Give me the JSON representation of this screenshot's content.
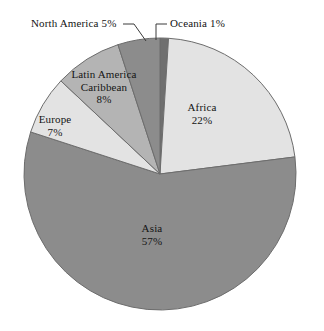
{
  "chart_data": {
    "type": "pie",
    "title": "",
    "subtitle": "",
    "xlabel": "",
    "ylabel": "",
    "legend_position": "none",
    "grid": false,
    "start_angle_deg": 0,
    "direction": "clockwise",
    "categories": [
      "Oceania",
      "Africa",
      "Asia",
      "Europe",
      "Latin America Caribbean",
      "North America"
    ],
    "values": [
      1,
      22,
      57,
      7,
      8,
      5
    ],
    "unit": "percent",
    "slices": [
      {
        "name": "Oceania",
        "label": "Oceania 1%",
        "label_lines": [
          "Oceania 1%"
        ],
        "value": 1,
        "value_text": "1%",
        "color": "#6f6f6f",
        "label_placement": "callout",
        "start_deg": 0,
        "end_deg": 3.6
      },
      {
        "name": "Africa",
        "label": "Africa 22%",
        "label_lines": [
          "Africa",
          "22%"
        ],
        "value": 22,
        "value_text": "22%",
        "color": "#e3e3e3",
        "label_placement": "inside",
        "start_deg": 3.6,
        "end_deg": 82.8
      },
      {
        "name": "Asia",
        "label": "Asia 57%",
        "label_lines": [
          "Asia",
          "57%"
        ],
        "value": 57,
        "value_text": "57%",
        "color": "#8c8c8c",
        "label_placement": "inside",
        "start_deg": 82.8,
        "end_deg": 288.0
      },
      {
        "name": "Europe",
        "label": "Europe 7%",
        "label_lines": [
          "Europe",
          "7%"
        ],
        "value": 7,
        "value_text": "7%",
        "color": "#e3e3e3",
        "label_placement": "inside",
        "start_deg": 288.0,
        "end_deg": 313.2
      },
      {
        "name": "Latin America Caribbean",
        "label": "Latin America Caribbean 8%",
        "label_lines": [
          "Latin America",
          "Caribbean",
          "8%"
        ],
        "value": 8,
        "value_text": "8%",
        "color": "#b4b4b4",
        "label_placement": "inside",
        "start_deg": 313.2,
        "end_deg": 342.0
      },
      {
        "name": "North America",
        "label": "North America 5%",
        "label_lines": [
          "North America 5%"
        ],
        "value": 5,
        "value_text": "5%",
        "color": "#8c8c8c",
        "label_placement": "callout",
        "start_deg": 342.0,
        "end_deg": 360.0
      }
    ],
    "geometry": {
      "center_x": 160,
      "center_y": 174,
      "radius": 136
    },
    "colors": {
      "background": "#ffffff",
      "outline": "#6d6d6d",
      "text": "#141414",
      "leader_line": "#3a3a3a"
    }
  },
  "labels": {
    "africa": "Africa\n22%",
    "asia": "Asia\n57%",
    "europe": "Europe\n7%",
    "latin_america": "Latin America\nCaribbean\n8%",
    "north_america": "North America 5%",
    "oceania": "Oceania 1%"
  }
}
